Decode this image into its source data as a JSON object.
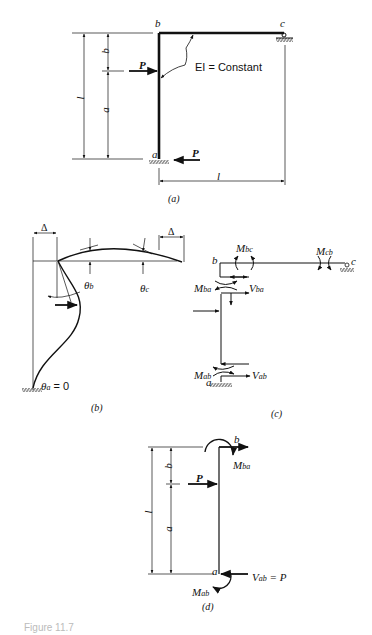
{
  "figure": {
    "caption_partial": "Figure 11.7",
    "panels": {
      "a": {
        "label": "(a)",
        "joints": {
          "a": "a",
          "b": "b",
          "c": "c"
        },
        "load_top": "P",
        "load_bottom": "P",
        "stiffness_note": "EI = Constant",
        "dim_total_height": "l",
        "dim_upper": "b",
        "dim_lower": "a",
        "dim_span": "l"
      },
      "b": {
        "label": "(b)",
        "delta_left": "Δ",
        "delta_right": "Δ",
        "theta_b": "θ",
        "theta_b_sub": "b",
        "theta_c": "θ",
        "theta_c_sub": "c",
        "theta_a": "θ",
        "theta_a_sub": "a",
        "theta_a_value": " = 0"
      },
      "c": {
        "label": "(c)",
        "joint_b": "b",
        "joint_c": "c",
        "joint_a": "a",
        "M_bc": "M",
        "M_bc_sub": "bc",
        "M_cb": "M",
        "M_cb_sub": "cb",
        "M_ba": "M",
        "M_ba_sub": "ba",
        "V_ba": "V",
        "V_ba_sub": "ba",
        "M_ab": "M",
        "M_ab_sub": "ab",
        "V_ab": "V",
        "V_ab_sub": "ab"
      },
      "d": {
        "label": "(d)",
        "joint_b": "b",
        "joint_a": "a",
        "load": "P",
        "M_ba": "M",
        "M_ba_sub": "ba",
        "M_ab": "M",
        "M_ab_sub": "ab",
        "V_ab": "V",
        "V_ab_sub": "ab",
        "V_ab_value": " = P",
        "dim_total_height": "l",
        "dim_upper": "b",
        "dim_lower": "a"
      }
    }
  }
}
